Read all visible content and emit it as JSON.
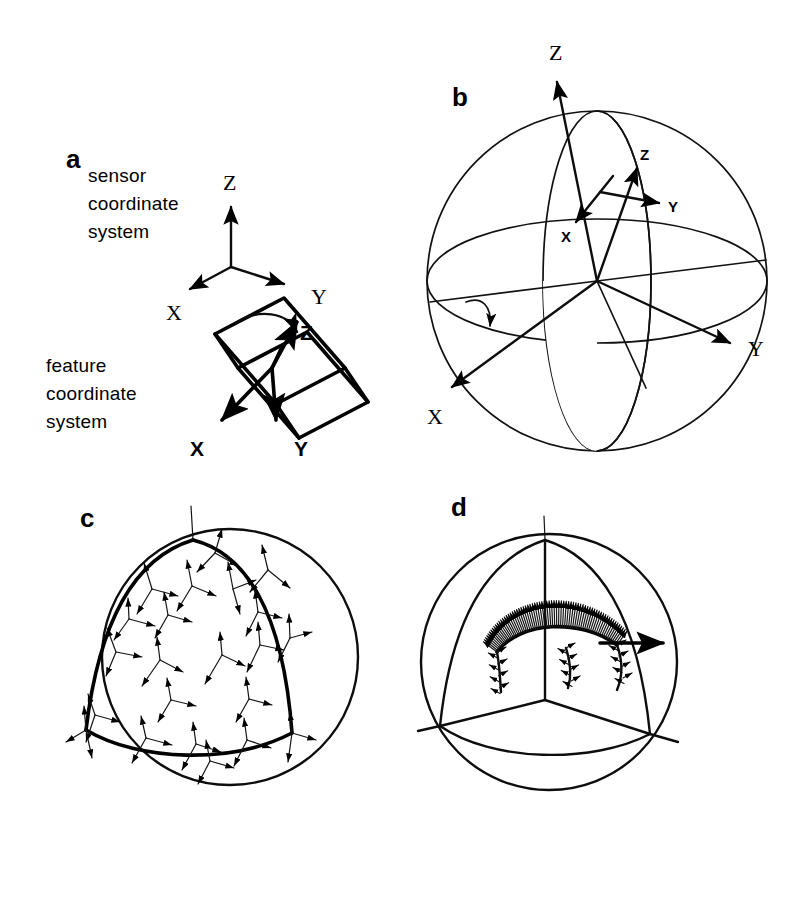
{
  "figure": {
    "background_color": "#ffffff",
    "ink_color": "#000000",
    "width": 795,
    "height": 901,
    "style": "scanned line drawing, black ink on white"
  },
  "panels": [
    {
      "id": "a",
      "label": "a",
      "label_pos": {
        "x": 66,
        "y": 168
      },
      "captions": [
        {
          "name": "sensor-coordinate-system",
          "lines": [
            "sensor",
            "coordinate",
            "system"
          ],
          "pos": {
            "x": 88,
            "y": 175
          }
        },
        {
          "name": "feature-coordinate-system",
          "lines": [
            "feature",
            "coordinate",
            "system"
          ],
          "pos": {
            "x": 46,
            "y": 364
          }
        }
      ],
      "sensor_triad": {
        "origin": {
          "x": 231,
          "y": 267
        },
        "axes": [
          {
            "label": "Z",
            "tip": {
              "x": 231,
              "y": 200
            },
            "label_pos": {
              "x": 231,
              "y": 188
            }
          },
          {
            "label": "X",
            "tip": {
              "x": 185,
              "y": 292
            },
            "label_pos": {
              "x": 173,
              "y": 315
            }
          },
          {
            "label": "Y",
            "tip": {
              "x": 289,
              "y": 286
            },
            "label_pos": {
              "x": 316,
              "y": 300
            }
          }
        ]
      },
      "feature_triad": {
        "origin": {
          "x": 272,
          "y": 368
        },
        "axes": [
          {
            "label": "Z",
            "tip": {
              "x": 288,
              "y": 332
            },
            "label_pos": {
              "x": 305,
              "y": 330
            }
          },
          {
            "label": "X",
            "tip": {
              "x": 217,
              "y": 424
            },
            "label_pos": {
              "x": 196,
              "y": 448
            }
          },
          {
            "label": "Y",
            "tip": {
              "x": 277,
              "y": 424
            },
            "label_pos": {
              "x": 301,
              "y": 448
            }
          }
        ],
        "rotation_arrow": true,
        "shape": "rotated rectangular slab (plate)"
      }
    },
    {
      "id": "b",
      "label": "b",
      "label_pos": {
        "x": 452,
        "y": 106
      },
      "sphere": {
        "cx": 597,
        "cy": 281,
        "r": 170
      },
      "global_axes": [
        {
          "label": "Z",
          "tip": {
            "x": 557,
            "y": 72
          },
          "label_pos": {
            "x": 558,
            "y": 58
          }
        },
        {
          "label": "X",
          "tip": {
            "x": 447,
            "y": 392
          },
          "label_pos": {
            "x": 435,
            "y": 417
          }
        },
        {
          "label": "Y",
          "tip": {
            "x": 737,
            "y": 344
          },
          "label_pos": {
            "x": 757,
            "y": 352
          }
        }
      ],
      "local_axes": [
        {
          "label": "Z",
          "label_pos": {
            "x": 645,
            "y": 156
          }
        },
        {
          "label": "Y",
          "label_pos": {
            "x": 672,
            "y": 206
          }
        },
        {
          "label": "X",
          "label_pos": {
            "x": 568,
            "y": 236
          }
        }
      ],
      "rotation_arrow": true,
      "features": [
        "outer sphere circle",
        "equator ellipse",
        "meridian arc",
        "radial spokes"
      ]
    },
    {
      "id": "c",
      "label": "c",
      "label_pos": {
        "x": 80,
        "y": 527
      },
      "sphere": {
        "cx": 230,
        "cy": 657,
        "r": 128
      },
      "description": "unit sphere with bold spherical-triangle (octant) boundary and sampled coordinate triads",
      "triad_count": 22
    },
    {
      "id": "d",
      "label": "d",
      "label_pos": {
        "x": 451,
        "y": 516
      },
      "sphere": {
        "cx": 549,
        "cy": 662,
        "r": 128
      },
      "description": "unit sphere with spherical-triangle wireframe and a dense fan of needle vectors along an arc",
      "needle_count": 70
    }
  ],
  "labels": {
    "axis_x": "X",
    "axis_y": "Y",
    "axis_z": "Z"
  }
}
